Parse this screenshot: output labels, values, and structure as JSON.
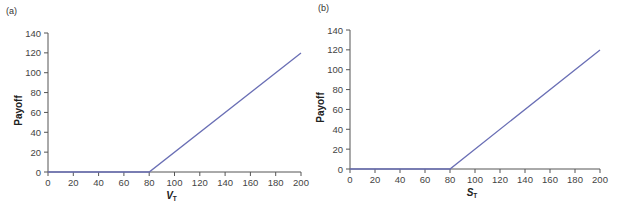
{
  "chart_data": [
    {
      "type": "line",
      "panel_label": "(a)",
      "title": "",
      "xlabel": "V",
      "xlabel_sub": "T",
      "ylabel": "Payoff",
      "xlim": [
        0,
        200
      ],
      "ylim": [
        0,
        140
      ],
      "xticks": [
        0,
        20,
        40,
        60,
        80,
        100,
        120,
        140,
        160,
        180,
        200
      ],
      "yticks": [
        0,
        20,
        40,
        60,
        80,
        100,
        120,
        140
      ],
      "grid": false,
      "series": [
        {
          "name": "payoff",
          "color": "#6a6fb5",
          "x": [
            0,
            80,
            200
          ],
          "y": [
            0,
            0,
            120
          ]
        }
      ]
    },
    {
      "type": "line",
      "panel_label": "(b)",
      "title": "",
      "xlabel": "S",
      "xlabel_sub": "T",
      "ylabel": "Payoff",
      "xlim": [
        0,
        200
      ],
      "ylim": [
        0,
        140
      ],
      "xticks": [
        0,
        20,
        40,
        60,
        80,
        100,
        120,
        140,
        160,
        180,
        200
      ],
      "yticks": [
        0,
        20,
        40,
        60,
        80,
        100,
        120,
        140
      ],
      "grid": false,
      "series": [
        {
          "name": "payoff",
          "color": "#6a6fb5",
          "x": [
            0,
            80,
            200
          ],
          "y": [
            0,
            0,
            120
          ]
        }
      ]
    }
  ]
}
